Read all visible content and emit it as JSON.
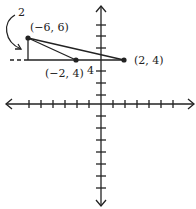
{
  "diagram": {
    "type": "coordinate-plane-triangle",
    "points": [
      {
        "label": "(−6, 6)",
        "px": [
          28,
          38
        ]
      },
      {
        "label": "(−2, 4)",
        "px": [
          76,
          60
        ]
      },
      {
        "label": "(2, 4)",
        "px": [
          124,
          60
        ]
      }
    ],
    "height_label": "2",
    "base_label": "4",
    "colors": {
      "stroke": "#222222",
      "background": "#ffffff"
    }
  }
}
